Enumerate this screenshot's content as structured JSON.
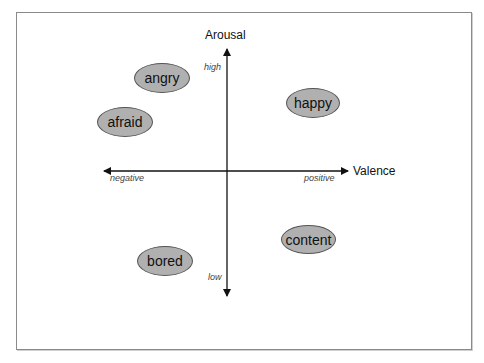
{
  "diagram": {
    "type": "circumplex-model-of-affect",
    "axes": {
      "vertical": {
        "title": "Arousal",
        "high_label": "high",
        "low_label": "low"
      },
      "horizontal": {
        "title": "Valence",
        "negative_label": "negative",
        "positive_label": "positive"
      }
    },
    "emotions": [
      {
        "label": "angry",
        "quadrant": "negative-high"
      },
      {
        "label": "afraid",
        "quadrant": "negative-high"
      },
      {
        "label": "happy",
        "quadrant": "positive-high"
      },
      {
        "label": "bored",
        "quadrant": "negative-low"
      },
      {
        "label": "content",
        "quadrant": "positive-low"
      }
    ],
    "colors": {
      "ellipse_fill": "#b0b0b0",
      "ellipse_border": "#555555",
      "axis": "#111111",
      "frame": "#8a8a8a"
    }
  }
}
